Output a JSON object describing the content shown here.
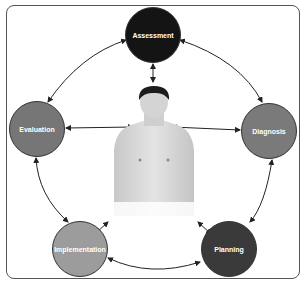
{
  "diagram": {
    "nodes": [
      {
        "id": "assessment",
        "label": "Assessment",
        "color": "#141414"
      },
      {
        "id": "diagnosis",
        "label": "Diagnosis",
        "color": "#7a7a7a"
      },
      {
        "id": "planning",
        "label": "Planning",
        "color": "#3a3a3a"
      },
      {
        "id": "implementation",
        "label": "Implementation",
        "color": "#9c9c9c"
      },
      {
        "id": "evaluation",
        "label": "Evaluation",
        "color": "#767676"
      }
    ],
    "center_image": "patient-photo",
    "edges": [
      "assessment<->diagnosis",
      "diagnosis<->planning",
      "planning<->implementation",
      "implementation<->evaluation",
      "evaluation<->assessment",
      "assessment<->patient",
      "diagnosis<->patient",
      "planning<->patient",
      "implementation<->patient",
      "evaluation<->patient"
    ]
  }
}
